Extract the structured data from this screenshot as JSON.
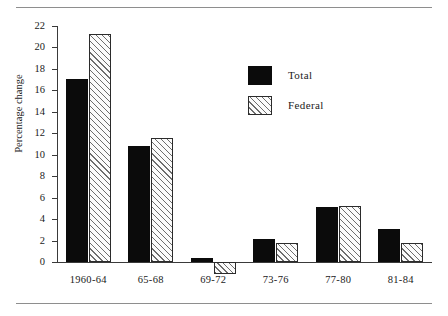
{
  "figure": {
    "rules": [
      "top-rule",
      "bottom-rule"
    ]
  },
  "legend": {
    "position": "upper-right-inside",
    "entries": [
      {
        "label": "Total",
        "swatch": "solid-black-swatch",
        "color": "#0b0b0b"
      },
      {
        "label": "Federal",
        "swatch": "diagonal-hatch-swatch",
        "color": "#fbfbfb"
      }
    ]
  },
  "chart_data": {
    "type": "bar",
    "title": "",
    "xlabel": "",
    "ylabel": "Percentage change",
    "categories": [
      "1960-64",
      "65-68",
      "69-72",
      "73-76",
      "77-80",
      "81-84"
    ],
    "series": [
      {
        "name": "Total",
        "values": [
          17.1,
          10.8,
          0.4,
          2.1,
          5.1,
          3.1
        ]
      },
      {
        "name": "Federal",
        "values": [
          21.3,
          11.6,
          -1.1,
          1.8,
          5.2,
          1.8
        ]
      }
    ],
    "ylim": [
      -2,
      22
    ],
    "yticks": [
      0,
      2,
      4,
      6,
      8,
      10,
      12,
      14,
      16,
      18,
      20,
      22
    ],
    "ytick_labels": [
      "0",
      "2",
      "4",
      "6",
      "8",
      "10",
      "12",
      "14",
      "16",
      "18",
      "20",
      "22"
    ],
    "grid": false,
    "legend_position": "upper right"
  }
}
